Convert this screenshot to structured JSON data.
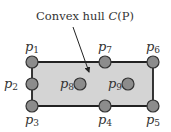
{
  "annotation": {
    "text_prefix": "Convex hull ",
    "text_symbol": "C",
    "text_arg": "(P)",
    "x": 36,
    "y": 20,
    "arrow_from": [
      73,
      27
    ],
    "arrow_to": [
      89,
      72
    ]
  },
  "hull": {
    "fill": "#d4d4d4",
    "stroke": "#222222",
    "corners": [
      [
        32,
        62
      ],
      [
        153,
        62
      ],
      [
        153,
        106
      ],
      [
        32,
        106
      ]
    ]
  },
  "point_style": {
    "fill": "#8c8c8c",
    "stroke": "#333333",
    "r": 6
  },
  "points": [
    {
      "name": "p",
      "sub": "1",
      "x": 32,
      "y": 62,
      "lx": 25,
      "ly": 51
    },
    {
      "name": "p",
      "sub": "2",
      "x": 32,
      "y": 84,
      "lx": 4,
      "ly": 88
    },
    {
      "name": "p",
      "sub": "3",
      "x": 32,
      "y": 106,
      "lx": 25,
      "ly": 124
    },
    {
      "name": "p",
      "sub": "4",
      "x": 105,
      "y": 106,
      "lx": 98,
      "ly": 124
    },
    {
      "name": "p",
      "sub": "5",
      "x": 153,
      "y": 106,
      "lx": 146,
      "ly": 124
    },
    {
      "name": "p",
      "sub": "6",
      "x": 153,
      "y": 62,
      "lx": 146,
      "ly": 51
    },
    {
      "name": "p",
      "sub": "7",
      "x": 105,
      "y": 62,
      "lx": 98,
      "ly": 51
    },
    {
      "name": "p",
      "sub": "8",
      "x": 80,
      "y": 84,
      "lx": 60,
      "ly": 88
    },
    {
      "name": "p",
      "sub": "9",
      "x": 128,
      "y": 84,
      "lx": 108,
      "ly": 88
    }
  ]
}
